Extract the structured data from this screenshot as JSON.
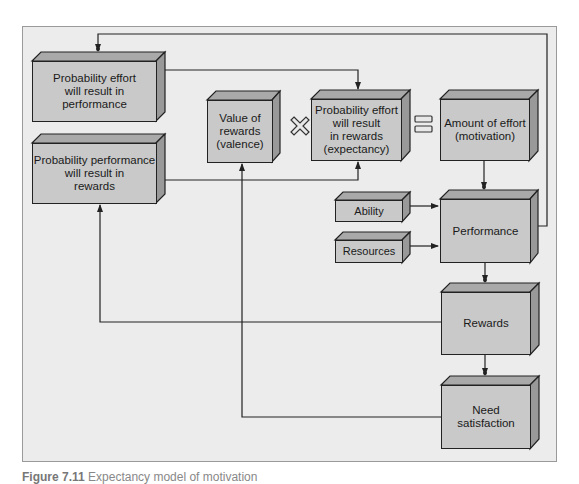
{
  "diagram": {
    "title": "Expectancy model of motivation",
    "colors": {
      "background": "#ececec",
      "box_front": "#c9c9c9",
      "box_top": "#a9a9a9",
      "box_side": "#999999",
      "line": "#222222"
    },
    "boxes": {
      "effort_performance": "Probability effort will result in performance",
      "performance_rewards": "Probability performance will result in rewards",
      "valence": "Value of rewards (valence)",
      "expectancy": "Probability effort will result in rewards (expectancy)",
      "motivation": "Amount of effort (motivation)",
      "ability": "Ability",
      "resources": "Resources",
      "performance": "Performance",
      "rewards": "Rewards",
      "need_satisfaction": "Need satisfaction"
    },
    "box_lines": {
      "effort_performance": [
        "Probability effort",
        "will result in",
        "performance"
      ],
      "performance_rewards": [
        "Probability performance",
        "will result in",
        "rewards"
      ],
      "valence": [
        "Value of",
        "rewards",
        "(valence)"
      ],
      "expectancy": [
        "Probability effort",
        "will result",
        "in rewards",
        "(expectancy)"
      ],
      "motivation": [
        "Amount of effort",
        "(motivation)"
      ],
      "need_satisfaction": [
        "Need",
        "satisfaction"
      ]
    },
    "operators": {
      "multiply": "×",
      "equals": "="
    },
    "edges": [
      {
        "from": "Performance",
        "to": "Probability effort will result in performance"
      },
      {
        "from": "Probability effort will result in performance",
        "to": "Probability effort will result in rewards (expectancy)"
      },
      {
        "from": "Probability performance will result in rewards",
        "to": "Probability effort will result in rewards (expectancy)"
      },
      {
        "from": "Amount of effort (motivation)",
        "to": "Performance"
      },
      {
        "from": "Ability",
        "to": "Performance"
      },
      {
        "from": "Resources",
        "to": "Performance"
      },
      {
        "from": "Performance",
        "to": "Rewards"
      },
      {
        "from": "Rewards",
        "to": "Need satisfaction"
      },
      {
        "from": "Rewards",
        "to": "Probability performance will result in rewards"
      },
      {
        "from": "Need satisfaction",
        "to": "Value of rewards (valence)"
      }
    ]
  },
  "caption": {
    "label": "Figure 7.11",
    "text": "Expectancy model of motivation"
  }
}
